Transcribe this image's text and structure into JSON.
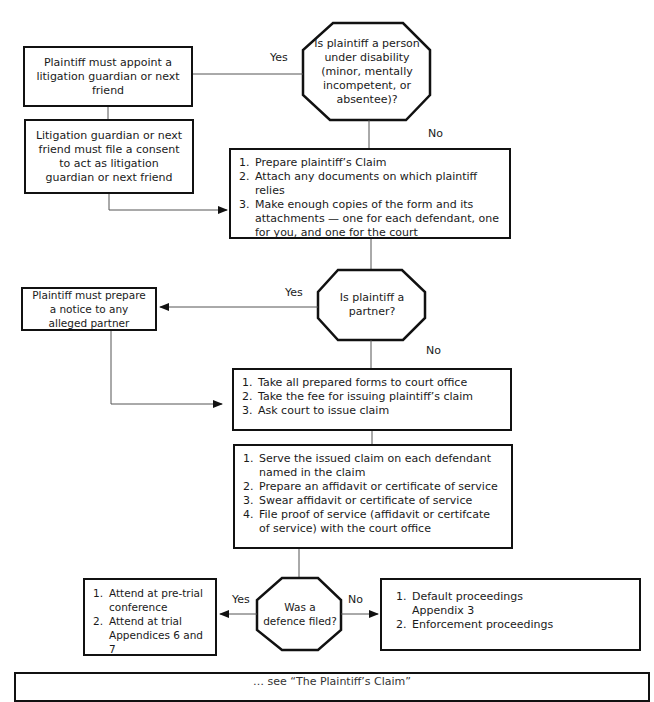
{
  "diagram": {
    "type": "flowchart",
    "decisions": {
      "disability": {
        "text": "Is plaintiff a person under disability (minor, mentally incompetent, or absentee)?",
        "yes_label": "Yes",
        "no_label": "No"
      },
      "partner": {
        "text": "Is plaintiff a partner?",
        "yes_label": "Yes",
        "no_label": "No"
      },
      "defence": {
        "text": "Was a defence filed?",
        "yes_label": "Yes",
        "no_label": "No"
      }
    },
    "boxes": {
      "appoint_guardian": {
        "text": "Plaintiff must appoint a litigation guardian or next friend"
      },
      "file_consent": {
        "text": "Litigation guardian or next friend must file a consent to act as litigation guardian or next friend"
      },
      "prepare_claim": {
        "items": [
          {
            "num": "1.",
            "text": "Prepare plaintiff’s Claim"
          },
          {
            "num": "2.",
            "text": "Attach any documents on which plaintiff relies"
          },
          {
            "num": "3.",
            "text": "Make enough copies of the form and its attachments — one for each defendant, one for you, and one for the court"
          }
        ]
      },
      "notice_partner": {
        "text": "Plaintiff must prepare a notice to any alleged partner"
      },
      "court_office": {
        "items": [
          {
            "num": "1.",
            "text": "Take all prepared forms to court office"
          },
          {
            "num": "2.",
            "text": "Take the fee for issuing plaintiff’s claim"
          },
          {
            "num": "3.",
            "text": "Ask court to issue claim"
          }
        ]
      },
      "serve_claim": {
        "items": [
          {
            "num": "1.",
            "text": "Serve the issued claim on each defendant named in the claim"
          },
          {
            "num": "2.",
            "text": "Prepare an affidavit or certificate of service"
          },
          {
            "num": "3.",
            "text": "Swear affidavit or certificate of service"
          },
          {
            "num": "4.",
            "text": "File proof of service (affidavit or certifcate of service) with the court office"
          }
        ]
      },
      "defence_yes": {
        "items": [
          {
            "num": "1.",
            "text": "Attend at pre-trial conference"
          },
          {
            "num": "2.",
            "text": "Attend at trial Appendices 6 and 7"
          }
        ]
      },
      "defence_no": {
        "items": [
          {
            "num": "1.",
            "text": "Default proceedings Appendix 3"
          },
          {
            "num": "2.",
            "text": "Enforcement proceedings"
          }
        ]
      }
    },
    "footer_note": {
      "text": "… see “The Plaintiff’s Claim”"
    }
  }
}
